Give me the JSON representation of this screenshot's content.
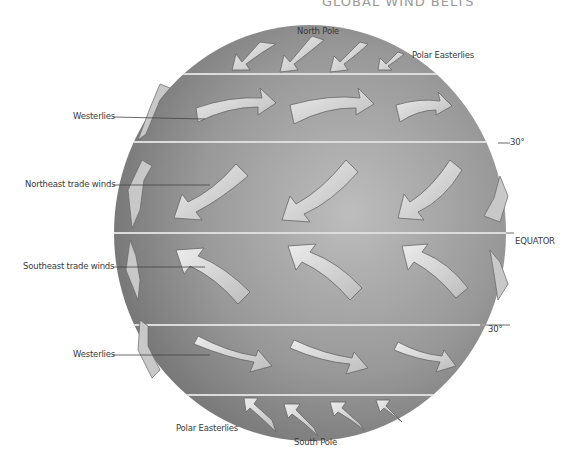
{
  "figure": {
    "title_partial": "GLOBAL WIND BELTS",
    "labels": {
      "north_pole": "North Pole",
      "south_pole": "South Pole",
      "polar_easterlies_north": "Polar Easterlies",
      "polar_easterlies_south": "Polar Easterlies",
      "westerlies_north": "Westerlies",
      "westerlies_south": "Westerlies",
      "northeast_trade_winds": "Northeast trade winds",
      "southeast_trade_winds": "Southeast trade winds",
      "lat_30_north": "30°",
      "lat_30_south": "30°",
      "equator": "EQUATOR"
    },
    "colors": {
      "globe_dark": "#7d7d7d",
      "globe_light": "#c4c4c4",
      "arrow_fill": "#d2d2d2",
      "arrow_stroke": "#6a6a6a",
      "band_line": "#e2e2e2"
    }
  }
}
